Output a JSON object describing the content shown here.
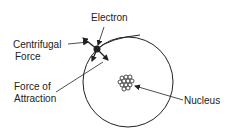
{
  "diagram": {
    "labels": {
      "electron": "Electron",
      "centrifugal_line1": "Centrifugal",
      "centrifugal_line2": "Force",
      "attraction_line1": "Force of",
      "attraction_line2": "Attraction",
      "nucleus": "Nucleus"
    },
    "colors": {
      "stroke": "#222222",
      "background": "#ffffff"
    }
  }
}
